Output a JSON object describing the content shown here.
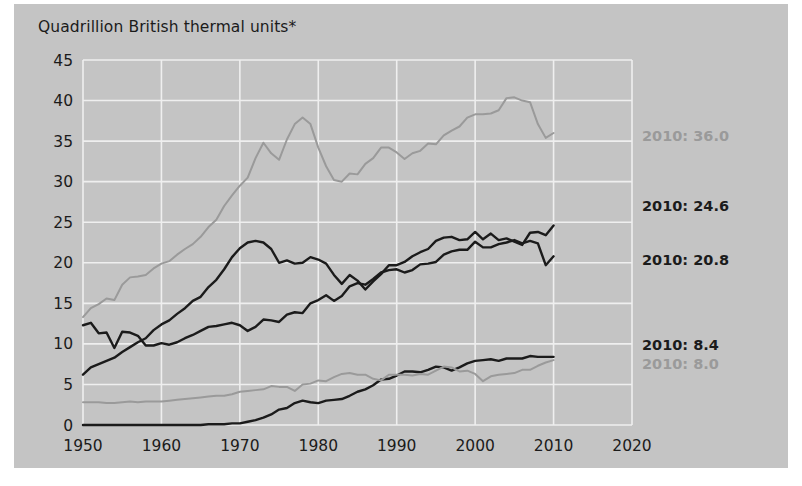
{
  "figure": {
    "title": "Quadrillion British thermal units*",
    "background_color": "#c4c4c4",
    "outer_background_color": "#ffffff",
    "grid_color": "#efefef",
    "text_color": "#1b1b1b"
  },
  "annotations": [
    {
      "name": "petroleum-endpoint-label",
      "text": "2010: 36.0",
      "color": "#9a9a9a",
      "value": 36.0,
      "year": 2010
    },
    {
      "name": "natural-gas-endpoint-label",
      "text": "2010: 24.6",
      "color": "#1b1b1b",
      "value": 24.6,
      "year": 2010
    },
    {
      "name": "coal-endpoint-label",
      "text": "2010: 20.8",
      "color": "#1b1b1b",
      "value": 20.8,
      "year": 2010
    },
    {
      "name": "nuclear-endpoint-label",
      "text": "2010: 8.4",
      "color": "#1b1b1b",
      "value": 8.4,
      "year": 2010
    },
    {
      "name": "renewables-endpoint-label",
      "text": "2010: 8.0",
      "color": "#9a9a9a",
      "value": 8.0,
      "year": 2010
    }
  ],
  "chart_data": {
    "type": "line",
    "title": "Quadrillion British thermal units*",
    "xlabel": "",
    "ylabel": "Quadrillion British thermal units*",
    "xlim": [
      1950,
      2020
    ],
    "ylim": [
      0,
      45
    ],
    "xticks": [
      1950,
      1960,
      1970,
      1980,
      1990,
      2000,
      2010,
      2020
    ],
    "yticks": [
      0,
      5,
      10,
      15,
      20,
      25,
      30,
      35,
      40,
      45
    ],
    "grid": true,
    "legend_position": "inline-right-endpoint-labels",
    "x": [
      1950,
      1951,
      1952,
      1953,
      1954,
      1955,
      1956,
      1957,
      1958,
      1959,
      1960,
      1961,
      1962,
      1963,
      1964,
      1965,
      1966,
      1967,
      1968,
      1969,
      1970,
      1971,
      1972,
      1973,
      1974,
      1975,
      1976,
      1977,
      1978,
      1979,
      1980,
      1981,
      1982,
      1983,
      1984,
      1985,
      1986,
      1987,
      1988,
      1989,
      1990,
      1991,
      1992,
      1993,
      1994,
      1995,
      1996,
      1997,
      1998,
      1999,
      2000,
      2001,
      2002,
      2003,
      2004,
      2005,
      2006,
      2007,
      2008,
      2009,
      2010
    ],
    "series": [
      {
        "name": "Petroleum",
        "color": "#9a9a9a",
        "width": 2,
        "endpoint_label": "2010: 36.0",
        "values": [
          13.3,
          14.4,
          14.9,
          15.6,
          15.4,
          17.3,
          18.2,
          18.3,
          18.5,
          19.3,
          19.9,
          20.2,
          21.0,
          21.7,
          22.3,
          23.2,
          24.4,
          25.3,
          27.0,
          28.3,
          29.5,
          30.5,
          32.9,
          34.8,
          33.5,
          32.7,
          35.2,
          37.1,
          37.9,
          37.1,
          34.2,
          31.9,
          30.2,
          30.0,
          31.0,
          30.9,
          32.2,
          32.9,
          34.2,
          34.2,
          33.6,
          32.8,
          33.5,
          33.8,
          34.7,
          34.6,
          35.7,
          36.3,
          36.8,
          37.9,
          38.3,
          38.3,
          38.4,
          38.8,
          40.3,
          40.4,
          40.0,
          39.8,
          37.1,
          35.4,
          36.0
        ]
      },
      {
        "name": "Natural gas",
        "color": "#1b1b1b",
        "width": 2.4,
        "endpoint_label": "2010: 24.6",
        "values": [
          6.2,
          7.1,
          7.5,
          7.9,
          8.3,
          9.0,
          9.6,
          10.2,
          10.7,
          11.7,
          12.4,
          12.9,
          13.7,
          14.4,
          15.3,
          15.8,
          17.0,
          17.9,
          19.2,
          20.7,
          21.8,
          22.5,
          22.7,
          22.5,
          21.7,
          20.0,
          20.3,
          19.9,
          20.0,
          20.7,
          20.4,
          19.9,
          18.5,
          17.4,
          18.5,
          17.8,
          16.7,
          17.7,
          18.6,
          19.7,
          19.7,
          20.1,
          20.8,
          21.3,
          21.7,
          22.7,
          23.1,
          23.2,
          22.8,
          22.9,
          23.8,
          22.9,
          23.6,
          22.8,
          23.0,
          22.6,
          22.2,
          23.7,
          23.8,
          23.4,
          24.6
        ]
      },
      {
        "name": "Coal",
        "color": "#1b1b1b",
        "width": 2.4,
        "endpoint_label": "2010: 20.8",
        "values": [
          12.3,
          12.6,
          11.3,
          11.4,
          9.5,
          11.5,
          11.4,
          11.0,
          9.8,
          9.8,
          10.1,
          9.9,
          10.2,
          10.7,
          11.1,
          11.6,
          12.1,
          12.2,
          12.4,
          12.6,
          12.3,
          11.6,
          12.1,
          13.0,
          12.9,
          12.7,
          13.6,
          13.9,
          13.8,
          15.0,
          15.4,
          16.0,
          15.3,
          15.9,
          17.1,
          17.5,
          17.3,
          18.0,
          18.8,
          19.1,
          19.2,
          18.8,
          19.1,
          19.8,
          19.9,
          20.1,
          21.0,
          21.4,
          21.6,
          21.6,
          22.6,
          21.9,
          21.9,
          22.3,
          22.5,
          22.8,
          22.4,
          22.7,
          22.4,
          19.7,
          20.8
        ]
      },
      {
        "name": "Nuclear electric power",
        "color": "#1b1b1b",
        "width": 2.4,
        "endpoint_label": "2010: 8.4",
        "values": [
          0.0,
          0.0,
          0.0,
          0.0,
          0.0,
          0.0,
          0.0,
          0.0,
          0.0,
          0.0,
          0.0,
          0.0,
          0.0,
          0.0,
          0.0,
          0.0,
          0.1,
          0.1,
          0.1,
          0.2,
          0.2,
          0.4,
          0.6,
          0.9,
          1.3,
          1.9,
          2.1,
          2.7,
          3.0,
          2.8,
          2.7,
          3.0,
          3.1,
          3.2,
          3.6,
          4.1,
          4.4,
          4.9,
          5.6,
          5.7,
          6.1,
          6.6,
          6.6,
          6.5,
          6.8,
          7.2,
          7.1,
          6.7,
          7.1,
          7.6,
          7.9,
          8.0,
          8.1,
          7.9,
          8.2,
          8.2,
          8.2,
          8.5,
          8.4,
          8.4,
          8.4
        ]
      },
      {
        "name": "Renewable energy",
        "color": "#9a9a9a",
        "width": 2,
        "endpoint_label": "2010: 8.0",
        "values": [
          2.8,
          2.8,
          2.8,
          2.7,
          2.7,
          2.8,
          2.9,
          2.8,
          2.9,
          2.9,
          2.9,
          3.0,
          3.1,
          3.2,
          3.3,
          3.4,
          3.5,
          3.6,
          3.6,
          3.8,
          4.1,
          4.2,
          4.3,
          4.4,
          4.8,
          4.7,
          4.7,
          4.2,
          5.0,
          5.1,
          5.5,
          5.4,
          5.9,
          6.3,
          6.4,
          6.2,
          6.2,
          5.7,
          5.5,
          6.2,
          6.2,
          6.2,
          6.1,
          6.3,
          6.2,
          6.7,
          7.2,
          7.1,
          6.6,
          6.7,
          6.3,
          5.4,
          6.0,
          6.2,
          6.3,
          6.4,
          6.8,
          6.8,
          7.3,
          7.7,
          8.0
        ]
      }
    ]
  }
}
